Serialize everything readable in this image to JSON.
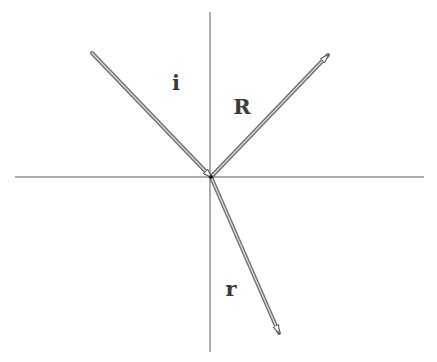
{
  "diagram": {
    "type": "ray-reflection-refraction",
    "canvas": {
      "width": 437,
      "height": 362,
      "background": "#ffffff"
    },
    "axes": {
      "horizontal": {
        "x1": 15,
        "y1": 177,
        "x2": 424,
        "y2": 177,
        "color": "#5a5a5a"
      },
      "vertical": {
        "x1": 210,
        "y1": 12,
        "x2": 210,
        "y2": 352,
        "color": "#5a5a5a"
      }
    },
    "origin": {
      "x": 211,
      "y": 177
    },
    "rays": [
      {
        "id": "incident",
        "label": "i",
        "x1": 92,
        "y1": 53,
        "x2": 211,
        "y2": 177,
        "arrow_at": "end"
      },
      {
        "id": "reflected",
        "label": "R",
        "x1": 211,
        "y1": 177,
        "x2": 328,
        "y2": 55,
        "arrow_at": "end"
      },
      {
        "id": "refracted",
        "label": "r",
        "x1": 211,
        "y1": 177,
        "x2": 279,
        "y2": 333,
        "arrow_at": "end"
      }
    ],
    "labels": {
      "incident": {
        "text": "i",
        "x": 176,
        "y": 90
      },
      "reflected": {
        "text": "R",
        "x": 242,
        "y": 114
      },
      "refracted": {
        "text": "r",
        "x": 231,
        "y": 296
      }
    },
    "ray_color": "#6e6e6e",
    "ray_fill": "#d8d8d8"
  }
}
